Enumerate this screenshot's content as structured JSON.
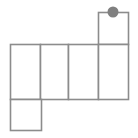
{
  "figure": {
    "background_color": "#ffffff",
    "line_color": "#8c8c8c",
    "line_width": 1.6,
    "marker_color": "#808080",
    "marker_edge_color": "#6e6e6e",
    "geometry": {
      "units": "px",
      "canvas": [
        138,
        138
      ],
      "grid_left": 10,
      "grid_right": 128,
      "row_top_y": 12,
      "row_middle_top_y": 44,
      "row_middle_bottom_y": 99,
      "row_bottom_y": 130,
      "column_x": [
        10,
        40,
        68,
        98,
        128
      ]
    },
    "chart_data": {
      "type": "diagram",
      "title": "",
      "shape": "polyomino-net",
      "cells": [
        {
          "name": "top-square",
          "row": "top",
          "x": 98,
          "y": 12,
          "width": 30,
          "height": 32,
          "label": ""
        },
        {
          "name": "middle-cell-1",
          "row": "middle",
          "x": 10,
          "y": 44,
          "width": 30,
          "height": 55,
          "label": ""
        },
        {
          "name": "middle-cell-2",
          "row": "middle",
          "x": 40,
          "y": 44,
          "width": 28,
          "height": 55,
          "label": ""
        },
        {
          "name": "middle-cell-3",
          "row": "middle",
          "x": 68,
          "y": 44,
          "width": 30,
          "height": 55,
          "label": ""
        },
        {
          "name": "middle-cell-4",
          "row": "middle",
          "x": 98,
          "y": 44,
          "width": 30,
          "height": 55,
          "label": ""
        },
        {
          "name": "bottom-square",
          "row": "bottom",
          "x": 10,
          "y": 99,
          "width": 31,
          "height": 31,
          "label": ""
        }
      ],
      "markers": [
        {
          "name": "vertex-dot",
          "cx": 113,
          "cy": 12,
          "r": 5.5,
          "color": "#808080",
          "label": ""
        }
      ],
      "annotations": [],
      "legend": [],
      "grid": false
    }
  }
}
